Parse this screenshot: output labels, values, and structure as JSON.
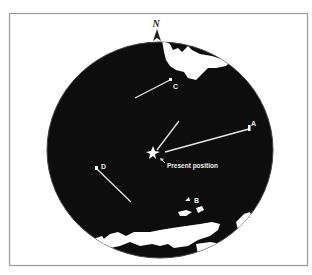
{
  "diagram": {
    "type": "radar-scope",
    "north_label": "N",
    "present_position_label": "Present position",
    "targets": [
      {
        "id": "A",
        "label": "A"
      },
      {
        "id": "B",
        "label": "B"
      },
      {
        "id": "C",
        "label": "C"
      },
      {
        "id": "D",
        "label": "D"
      }
    ],
    "colors": {
      "scope": "#0d0d0d",
      "land": "#ffffff",
      "frame": "#9a9a9a",
      "trail": "#e6e6e6",
      "text": "#eeeeee"
    }
  }
}
